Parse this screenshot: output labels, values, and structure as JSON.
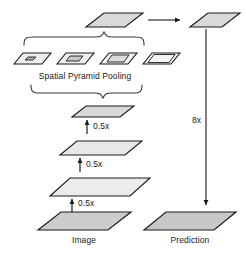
{
  "diagram": {
    "type": "architecture-flow",
    "colors": {
      "stroke": "#1a1a1a",
      "fill_light": "#efefef",
      "fill_mid": "#e2e2e2",
      "fill_dark": "#d4d4d4",
      "background": "#ffffff",
      "text": "#1a1a1a"
    }
  },
  "labels": {
    "pooling": "Spatial Pyramid Pooling",
    "scale_1": "0.5x",
    "scale_2": "0.5x",
    "scale_3": "0.5x",
    "upsample": "8x",
    "image": "Image",
    "prediction": "Prediction"
  },
  "nodes": {
    "image": {
      "name": "Image",
      "caption": "Image",
      "level": 0,
      "relative_size": 1.0
    },
    "feature_half": {
      "name": "feature map 1/2",
      "level": 1,
      "relative_size": 0.5
    },
    "feature_quarter": {
      "name": "feature map 1/4",
      "level": 2,
      "relative_size": 0.25
    },
    "feature_eighth": {
      "name": "feature map 1/8",
      "level": 3,
      "relative_size": 0.125
    },
    "fused": {
      "name": "fused feature map",
      "level": 4,
      "relative_size": 0.125
    },
    "output": {
      "name": "output feature map",
      "level": 5,
      "relative_size": 0.125
    },
    "prediction": {
      "name": "Prediction",
      "caption": "Prediction",
      "level": 6,
      "relative_size": 1.0
    }
  },
  "pyramid_bins": [
    {
      "index": 1,
      "bin": "1x1",
      "inner_relative": 0.18
    },
    {
      "index": 2,
      "bin": "2x2",
      "inner_relative": 0.34
    },
    {
      "index": 3,
      "bin": "3x3",
      "inner_relative": 0.52
    },
    {
      "index": 4,
      "bin": "6x6",
      "inner_relative": 0.72
    }
  ],
  "edges": [
    {
      "from": "image",
      "to": "feature_half",
      "label": "0.5x",
      "kind": "arrow-up"
    },
    {
      "from": "feature_half",
      "to": "feature_quarter",
      "label": "0.5x",
      "kind": "arrow-up"
    },
    {
      "from": "feature_quarter",
      "to": "feature_eighth",
      "label": "0.5x",
      "kind": "arrow-up"
    },
    {
      "from": "feature_eighth",
      "to": "pyramid_bins",
      "label": "",
      "kind": "brace-down"
    },
    {
      "from": "pyramid_bins",
      "to": "fused",
      "label": "",
      "kind": "brace-up"
    },
    {
      "from": "fused",
      "to": "output",
      "label": "",
      "kind": "arrow-right"
    },
    {
      "from": "output",
      "to": "prediction",
      "label": "8x",
      "kind": "arrow-down"
    }
  ]
}
